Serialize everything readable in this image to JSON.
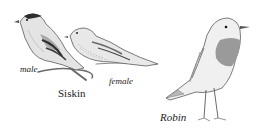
{
  "image": {
    "description": "Pencil illustration of birds: male and female Siskin perched on a branch, and a Robin standing",
    "birds": [
      {
        "name": "Siskin",
        "variants": [
          "male",
          "female"
        ]
      },
      {
        "name": "Robin"
      }
    ]
  },
  "labels": {
    "male": "male",
    "female": "female",
    "siskin": "Siskin",
    "robin": "Robin"
  },
  "colors": {
    "background": "#ffffff",
    "pencil_dark": "#3a3a3a",
    "pencil_mid": "#8a8a8a",
    "pencil_light": "#c8c8c8",
    "robin_breast": "#9a9a9a"
  }
}
